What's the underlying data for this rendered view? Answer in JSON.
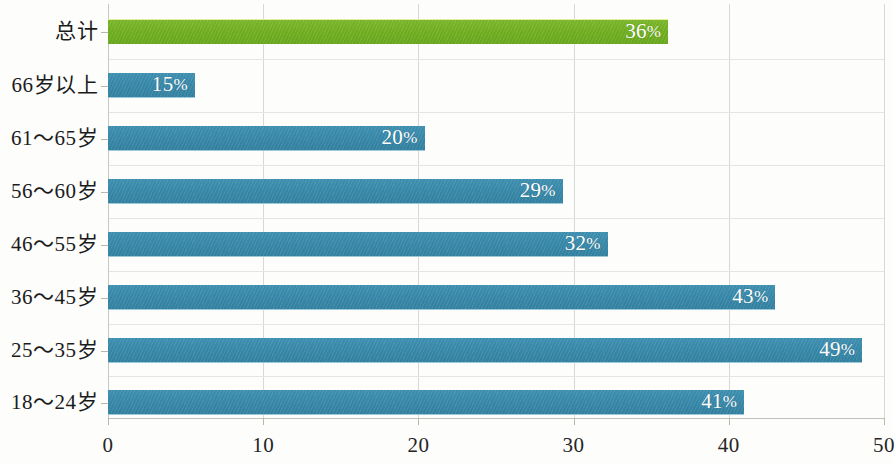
{
  "chart_data": {
    "type": "bar",
    "orientation": "horizontal",
    "title": "",
    "xlabel": "",
    "ylabel": "",
    "xlim": [
      0,
      50
    ],
    "xticks": [
      "0",
      "10",
      "20",
      "30",
      "40",
      "50"
    ],
    "xtick_values": [
      0,
      10,
      20,
      30,
      40,
      50
    ],
    "grid": true,
    "legend": "none",
    "categories": [
      "总计",
      "66岁以上",
      "61～65岁",
      "56～60岁",
      "46～55岁",
      "36～45岁",
      "25～35岁",
      "18～24岁"
    ],
    "values": [
      36,
      15,
      20,
      29,
      32,
      43,
      49,
      41
    ],
    "value_labels": [
      "36%",
      "15%",
      "20%",
      "29%",
      "32%",
      "43%",
      "49%",
      "41%"
    ],
    "bar_pixel_lengths": [
      36.1,
      5.6,
      20.4,
      29.3,
      32.2,
      43.0,
      48.6,
      41.0
    ],
    "colors": {
      "total_bar": "#6eac1f",
      "category_bar": "#3787a8",
      "gridline": "#e6e5e2",
      "axis": "#c2c0bb",
      "label_text": "#1b1b1b",
      "value_text": "#ffffff",
      "background": "#fdfdfc"
    },
    "bars": [
      {
        "category": "总计",
        "value": 36,
        "label": "36%",
        "color_key": "total_bar",
        "bar_units": 36.1
      },
      {
        "category": "66岁以上",
        "value": 15,
        "label": "15%",
        "color_key": "category_bar",
        "bar_units": 5.6
      },
      {
        "category": "61～65岁",
        "value": 20,
        "label": "20%",
        "color_key": "category_bar",
        "bar_units": 20.4
      },
      {
        "category": "56～60岁",
        "value": 29,
        "label": "29%",
        "color_key": "category_bar",
        "bar_units": 29.3
      },
      {
        "category": "46～55岁",
        "value": 32,
        "label": "32%",
        "color_key": "category_bar",
        "bar_units": 32.2
      },
      {
        "category": "36～45岁",
        "value": 43,
        "label": "43%",
        "color_key": "category_bar",
        "bar_units": 43.0
      },
      {
        "category": "25～35岁",
        "value": 49,
        "label": "49%",
        "color_key": "category_bar",
        "bar_units": 48.6
      },
      {
        "category": "18～24岁",
        "value": 41,
        "label": "41%",
        "color_key": "category_bar",
        "bar_units": 41.0
      }
    ]
  }
}
